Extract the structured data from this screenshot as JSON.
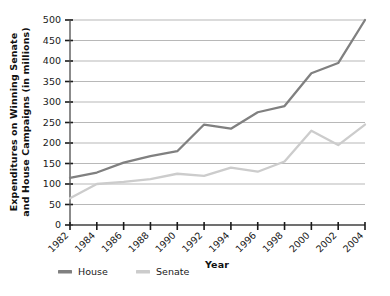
{
  "chart_data": {
    "type": "line",
    "title": "",
    "xlabel": "Year",
    "ylabel": "Expenditures on Winning Senate and House Campaigns (in millions)",
    "ylabel_line1": "Expenditures on Winning Senate",
    "ylabel_line2": "and House Campaigns (in millions)",
    "x": [
      1982,
      1984,
      1986,
      1988,
      1990,
      1992,
      1994,
      1996,
      1998,
      2000,
      2002,
      2004
    ],
    "categories": [
      "1982",
      "1984",
      "1986",
      "1988",
      "1990",
      "1992",
      "1994",
      "1996",
      "1998",
      "2000",
      "2002",
      "2004"
    ],
    "series": [
      {
        "name": "House",
        "color": "#808080",
        "values": [
          115,
          128,
          152,
          168,
          180,
          245,
          235,
          275,
          290,
          370,
          395,
          500
        ]
      },
      {
        "name": "Senate",
        "color": "#cccccc",
        "values": [
          65,
          100,
          105,
          112,
          125,
          120,
          140,
          130,
          155,
          230,
          195,
          245
        ]
      }
    ],
    "ylim": [
      0,
      500
    ],
    "yticks": [
      0,
      50,
      100,
      150,
      200,
      250,
      300,
      350,
      400,
      450,
      500
    ],
    "ytick_labels": [
      "0",
      "50",
      "100",
      "150",
      "200",
      "250",
      "300",
      "350",
      "400",
      "450",
      "500"
    ],
    "xtick_labels": [
      "1982",
      "1984",
      "1986",
      "1988",
      "1990",
      "1992",
      "1994",
      "1996",
      "1998",
      "2000",
      "2002",
      "2004"
    ],
    "grid": true,
    "grid_axis": "y",
    "legend_position": "bottom-left",
    "legend": [
      {
        "label": "House",
        "color": "#808080"
      },
      {
        "label": "Senate",
        "color": "#cccccc"
      }
    ],
    "xtick_rotation": 45
  }
}
